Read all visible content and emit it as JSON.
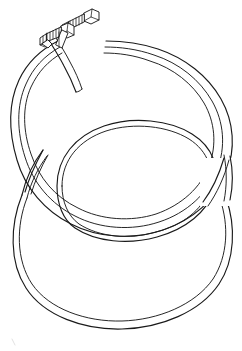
{
  "image": {
    "title": "Coiled hose assembly line drawing",
    "subject": "coiled-hose-with-threaded-fitting",
    "style": "black-and-white technical line art",
    "background_color": "#ffffff",
    "line_color": "#1a1a1a",
    "width": 242,
    "height": 351,
    "visible_text": "",
    "parts": [
      {
        "id": "upper-coil",
        "label": "upper hose loop",
        "description": "large open ellipse forming the upper turn of the coil, drawn with double outline walls"
      },
      {
        "id": "lower-coil",
        "label": "lower hose loop",
        "description": "large open ellipse forming the lower turn of the coil, crossing behind the upper loop at left and right"
      },
      {
        "id": "fitting-assembly",
        "label": "threaded end fitting",
        "description": "two threaded connector ends with hex nuts at the top left, where the hose terminates"
      },
      {
        "id": "hose-end-short",
        "label": "short hose tail",
        "description": "short length of hose running from the lower fitting down into the upper loop"
      }
    ],
    "fitting": {
      "count": 2,
      "features": [
        "hex-nut",
        "threaded-stud",
        "ferrule",
        "crimped-collar"
      ]
    },
    "geometry": {
      "upper_loop_center": [
        118,
        128
      ],
      "upper_loop_radii": [
        103,
        92
      ],
      "lower_loop_center": [
        122,
        222
      ],
      "lower_loop_radii": [
        104,
        98
      ],
      "inner_ellipse_center": [
        125,
        185
      ],
      "inner_ellipse_radii": [
        69,
        70
      ],
      "fitting_origin": [
        46,
        42
      ]
    }
  }
}
